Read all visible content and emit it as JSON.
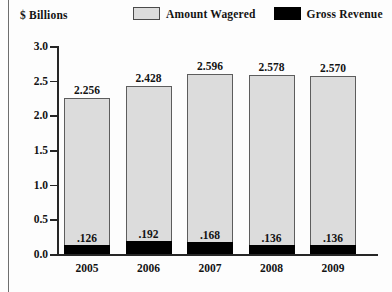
{
  "axis_title": "$ Billions",
  "legend": {
    "position": "top",
    "items": [
      {
        "label": "Amount Wagered",
        "swatch": "wagered",
        "color": "#dcdcdc"
      },
      {
        "label": "Gross Revenue",
        "swatch": "revenue",
        "color": "#000000"
      }
    ]
  },
  "chart_data": {
    "type": "bar",
    "stacked": true,
    "title": "",
    "subtitle": "",
    "xlabel": "",
    "ylabel": "$ Billions",
    "ylim": [
      0.0,
      3.0
    ],
    "ytick_step": 0.5,
    "grid": false,
    "legend_position": "top",
    "categories": [
      "2005",
      "2006",
      "2007",
      "2008",
      "2009"
    ],
    "ytick_labels": [
      "0.0",
      "0.5",
      "1.0",
      "1.5",
      "2.0",
      "2.5",
      "3.0"
    ],
    "ytick_values": [
      0.0,
      0.5,
      1.0,
      1.5,
      2.0,
      2.5,
      3.0
    ],
    "series": [
      {
        "name": "Amount Wagered",
        "color": "#dcdcdc",
        "values": [
          2.256,
          2.428,
          2.596,
          2.578,
          2.57
        ],
        "data_labels": [
          "2.256",
          "2.428",
          "2.596",
          "2.578",
          "2.570"
        ]
      },
      {
        "name": "Gross Revenue",
        "color": "#000000",
        "values": [
          0.126,
          0.192,
          0.168,
          0.136,
          0.136
        ],
        "data_labels": [
          ".126",
          ".192",
          ".168",
          ".136",
          ".136"
        ]
      }
    ]
  }
}
